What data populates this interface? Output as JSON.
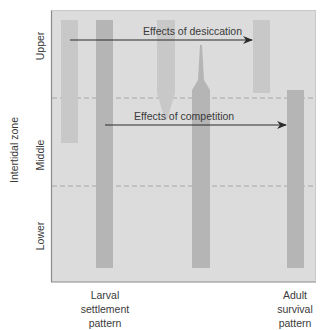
{
  "figure": {
    "y_axis_title": "Intertidal zone",
    "zones": [
      "Upper",
      "Middle",
      "Lower"
    ],
    "arrows": [
      {
        "label": "Effects of desiccation"
      },
      {
        "label": "Effects of competition"
      }
    ],
    "x_labels": [
      {
        "lines": [
          "Larval",
          "settlement",
          "pattern"
        ]
      },
      {
        "lines": [
          "Adult",
          "survival",
          "pattern"
        ]
      }
    ]
  },
  "colors": {
    "plot_background": "#dcdcdc",
    "light_bar": "#c8c8c8",
    "dark_bar": "#b5b5b5",
    "arrow": "#2a2a2a",
    "dashed_line": "#9a9a9a"
  }
}
